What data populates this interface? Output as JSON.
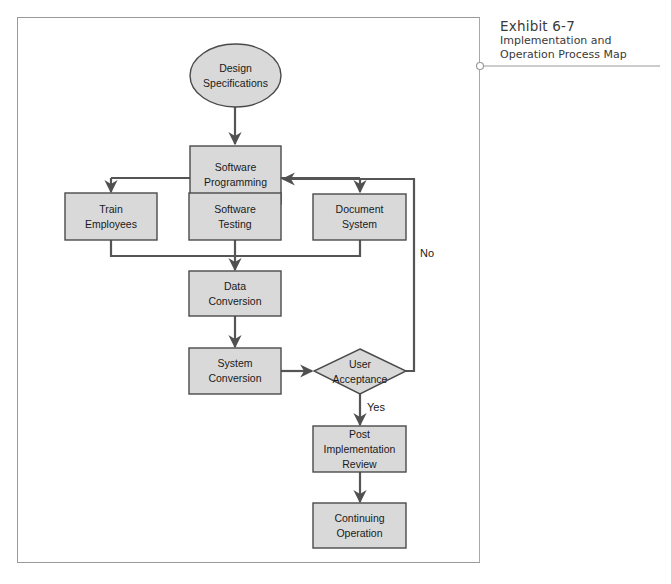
{
  "caption": {
    "exhibit": "Exhibit 6-7",
    "title_line1": "Implementation and",
    "title_line2": "Operation Process Map"
  },
  "diagram": {
    "nodes": [
      {
        "id": "design_specs",
        "shape": "ellipse",
        "label": "Design\nSpecifications"
      },
      {
        "id": "software_programming",
        "shape": "rect",
        "label": "Software\nProgramming"
      },
      {
        "id": "train_employees",
        "shape": "rect",
        "label": "Train\nEmployees"
      },
      {
        "id": "software_testing",
        "shape": "rect",
        "label": "Software\nTesting"
      },
      {
        "id": "document_system",
        "shape": "rect",
        "label": "Document\nSystem"
      },
      {
        "id": "data_conversion",
        "shape": "rect",
        "label": "Data\nConversion"
      },
      {
        "id": "system_conversion",
        "shape": "rect",
        "label": "System\nConversion"
      },
      {
        "id": "user_acceptance",
        "shape": "diamond",
        "label": "User\nAcceptance"
      },
      {
        "id": "post_impl_review",
        "shape": "rect",
        "label": "Post\nImplementation\nReview"
      },
      {
        "id": "continuing_operation",
        "shape": "rect",
        "label": "Continuing\nOperation"
      }
    ],
    "edges": [
      {
        "from": "design_specs",
        "to": "software_programming"
      },
      {
        "from": "software_programming",
        "to": "train_employees"
      },
      {
        "from": "software_programming",
        "to": "software_testing"
      },
      {
        "from": "software_programming",
        "to": "document_system"
      },
      {
        "from": "train_employees",
        "to": "data_conversion"
      },
      {
        "from": "software_testing",
        "to": "data_conversion"
      },
      {
        "from": "document_system",
        "to": "data_conversion"
      },
      {
        "from": "data_conversion",
        "to": "system_conversion"
      },
      {
        "from": "system_conversion",
        "to": "user_acceptance"
      },
      {
        "from": "user_acceptance",
        "to": "post_impl_review",
        "label": "Yes"
      },
      {
        "from": "user_acceptance",
        "to": "software_programming",
        "label": "No"
      },
      {
        "from": "post_impl_review",
        "to": "continuing_operation"
      }
    ],
    "edge_labels": {
      "yes": "Yes",
      "no": "No"
    },
    "colors": {
      "fill": "#d9d9d9",
      "stroke": "#4a4a4a",
      "line": "#555555",
      "frame": "#9a9a9a"
    }
  }
}
